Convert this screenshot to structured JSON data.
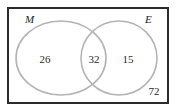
{
  "figure": {
    "type": "venn-diagram",
    "sets_count": 2,
    "universe_border_color": "#2b2b2b",
    "circle_stroke_color": "#b4b4b4",
    "background_color": "#ffffff"
  },
  "labels": {
    "set_m": "M",
    "set_e": "E"
  },
  "counts": {
    "m_only": "26",
    "intersection": "32",
    "e_only": "15",
    "outside": "72"
  }
}
